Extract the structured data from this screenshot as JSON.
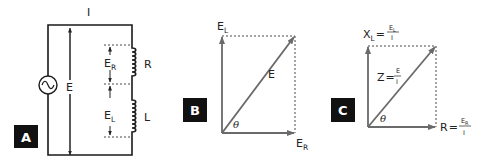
{
  "panels": {
    "a": {
      "badge": "A",
      "current_label": "I",
      "source_voltage_label": "E",
      "resistor": {
        "voltage_label": "E",
        "voltage_sub": "R",
        "component_label": "R"
      },
      "inductor": {
        "voltage_label": "E",
        "voltage_sub": "L",
        "component_label": "L"
      },
      "source_icon": "ac-source-icon"
    },
    "b": {
      "badge": "B",
      "vertical_vector": {
        "label": "E",
        "sub": "L"
      },
      "horizontal_vector": {
        "label": "E",
        "sub": "R"
      },
      "resultant_vector": {
        "label": "E"
      },
      "angle_label": "θ"
    },
    "c": {
      "badge": "C",
      "vertical_vector": {
        "label": "X",
        "sub": "L",
        "eq": "=",
        "num": "E",
        "num_sub": "L",
        "den": "I"
      },
      "horizontal_vector": {
        "label": "R",
        "eq": "=",
        "num": "E",
        "num_sub": "R",
        "den": "I"
      },
      "resultant_vector": {
        "label": "Z",
        "eq": "=",
        "num": "E",
        "den": "I"
      },
      "angle_label": "θ"
    }
  },
  "colors": {
    "badge_bg": "#111111",
    "badge_text": "#ffffff",
    "vector": "#6a6a6a",
    "wire": "#1a1a1a"
  }
}
